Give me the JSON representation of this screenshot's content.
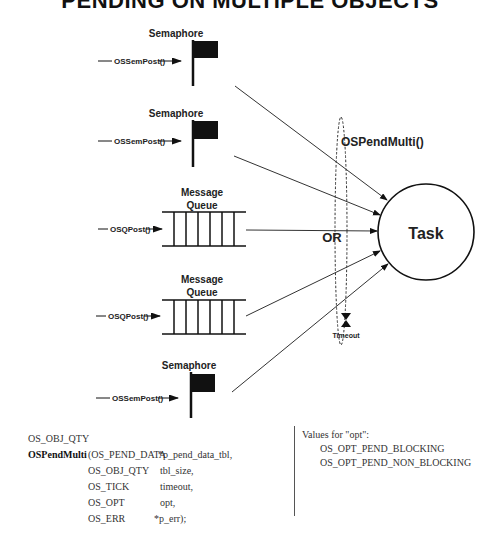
{
  "title": "PENDING ON MULTIPLE OBJECTS",
  "diagram": {
    "sources": [
      {
        "type": "semaphore",
        "label": "Semaphore",
        "post_call": "OSSemPost()"
      },
      {
        "type": "semaphore",
        "label": "Semaphore",
        "post_call": "OSSemPost()"
      },
      {
        "type": "queue",
        "label_line1": "Message",
        "label_line2": "Queue",
        "post_call": "OSQPost()"
      },
      {
        "type": "queue",
        "label_line1": "Message",
        "label_line2": "Queue",
        "post_call": "OSQPost()"
      },
      {
        "type": "semaphore",
        "label": "Semaphore",
        "post_call": "OSSemPost()"
      }
    ],
    "pend_function": "OSPendMulti()",
    "or_label": "OR",
    "task_label": "Task",
    "timeout_label": "Timeout"
  },
  "code": {
    "return_type": "OS_OBJ_QTY",
    "function_name": "OSPendMulti",
    "params": [
      {
        "type": "(OS_PEND_DATA",
        "name": "*p_pend_data_tbl,"
      },
      {
        "type": "OS_OBJ_QTY",
        "name": "tbl_size,"
      },
      {
        "type": "OS_TICK",
        "name": "timeout,"
      },
      {
        "type": "OS_OPT",
        "name": "opt,"
      },
      {
        "type": "OS_ERR",
        "name": "*p_err);"
      }
    ]
  },
  "options": {
    "heading": "Values for \"opt\":",
    "values": [
      "OS_OPT_PEND_BLOCKING",
      "OS_OPT_PEND_NON_BLOCKING"
    ]
  }
}
